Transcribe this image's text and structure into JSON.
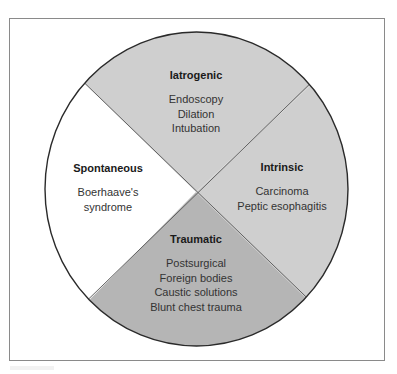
{
  "diagram": {
    "title": "",
    "type": "segmented-circle",
    "colors": {
      "frame_border": "#8a8a8a",
      "circle_outline": "#2a2a2a",
      "light_segment": "#cfcfcf",
      "dark_segment": "#b5b5b5",
      "white_segment": "#ffffff",
      "divider": "#555555"
    },
    "segments": [
      {
        "id": "iatrogenic",
        "title": "Iatrogenic",
        "position": "top",
        "fill": "#cfcfcf",
        "items": [
          "Endoscopy",
          "Dilation",
          "Intubation"
        ]
      },
      {
        "id": "intrinsic",
        "title": "Intrinsic",
        "position": "right",
        "fill": "#cfcfcf",
        "items": [
          "Carcinoma",
          "Peptic esophagitis"
        ]
      },
      {
        "id": "traumatic",
        "title": "Traumatic",
        "position": "bottom",
        "fill": "#b5b5b5",
        "items": [
          "Postsurgical",
          "Foreign bodies",
          "Caustic solutions",
          "Blunt chest trauma"
        ]
      },
      {
        "id": "spontaneous",
        "title": "Spontaneous",
        "position": "left",
        "fill": "#ffffff",
        "items": [
          "Boerhaave's",
          "syndrome"
        ]
      }
    ]
  }
}
